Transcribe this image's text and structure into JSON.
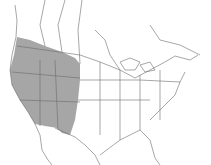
{
  "map": {
    "type": "species-range-map",
    "region": "North America",
    "shaded_region": "Western United States and southwestern Canada",
    "colors": {
      "range_fill": "#a6a6a6",
      "borders": "#6b6b6b",
      "background": "#ffffff"
    }
  }
}
